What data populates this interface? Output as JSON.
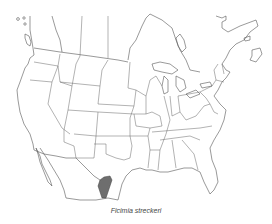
{
  "figure": {
    "type": "species-range-map",
    "region": "North America (Canada, United States, Mexico)",
    "caption": "Ficimia streckeri",
    "range_fill_color": "#6e6e6e",
    "border_color": "#555555",
    "range_description": "Shaded range in southern Texas and northeastern Mexico"
  }
}
